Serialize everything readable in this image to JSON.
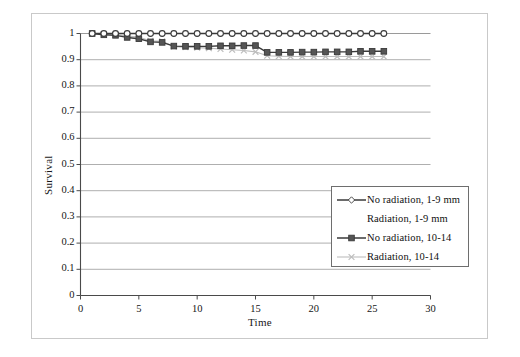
{
  "chart_data": {
    "type": "line",
    "title": "",
    "xlabel": "Time",
    "ylabel": "Survival",
    "xlim": [
      0,
      30
    ],
    "ylim": [
      0,
      1
    ],
    "xticks": [
      0,
      5,
      10,
      15,
      20,
      25,
      30
    ],
    "yticks": [
      0,
      0.1,
      0.2,
      0.3,
      0.4,
      0.5,
      0.6,
      0.7,
      0.8,
      0.9,
      1
    ],
    "xtick_labels": [
      "0",
      "5",
      "10",
      "15",
      "20",
      "25",
      "30"
    ],
    "ytick_labels": [
      "0",
      "0.1",
      "0.2",
      "0.3",
      "0.4",
      "0.5",
      "0.6",
      "0.7",
      "0.8",
      "0.9",
      "1"
    ],
    "grid": "horizontal",
    "legend_position": "lower-right-inside",
    "series": [
      {
        "name": "No radiation, 1-9 mm",
        "marker": "open-circle",
        "color": "#3a3a3a",
        "marker_fill": "#ffffff",
        "x": [
          1,
          2,
          3,
          4,
          5,
          6,
          7,
          8,
          9,
          10,
          11,
          12,
          13,
          14,
          15,
          16,
          17,
          18,
          19,
          20,
          21,
          22,
          23,
          24,
          25,
          26
        ],
        "values": [
          1.0,
          1.0,
          1.0,
          1.0,
          1.0,
          1.0,
          1.0,
          1.0,
          1.0,
          1.0,
          1.0,
          1.0,
          1.0,
          1.0,
          1.0,
          1.0,
          1.0,
          1.0,
          1.0,
          1.0,
          1.0,
          1.0,
          1.0,
          1.0,
          1.0,
          1.0
        ]
      },
      {
        "name": "Radiation, 1-9 mm",
        "marker": "none",
        "color": "#e8e8e8",
        "marker_fill": "#ffffff",
        "x": [
          1,
          2,
          3,
          4,
          5,
          6,
          7,
          8,
          9,
          10,
          11,
          12,
          13,
          14,
          15,
          16,
          17,
          18,
          19,
          20,
          21,
          22,
          23,
          24,
          25,
          26
        ],
        "values": [
          1.0,
          1.0,
          1.0,
          1.0,
          1.0,
          1.0,
          1.0,
          1.0,
          1.0,
          1.0,
          1.0,
          1.0,
          1.0,
          1.0,
          1.0,
          1.0,
          1.0,
          1.0,
          1.0,
          1.0,
          1.0,
          1.0,
          1.0,
          1.0,
          1.0,
          1.0
        ]
      },
      {
        "name": "No radiation, 10-14",
        "marker": "filled-square",
        "color": "#3a3a3a",
        "marker_fill": "#555555",
        "x": [
          1,
          2,
          3,
          4,
          5,
          6,
          7,
          8,
          9,
          10,
          11,
          12,
          13,
          14,
          15,
          16,
          17,
          18,
          19,
          20,
          21,
          22,
          23,
          24,
          25,
          26
        ],
        "values": [
          1.0,
          0.995,
          0.993,
          0.985,
          0.98,
          0.968,
          0.966,
          0.952,
          0.951,
          0.951,
          0.951,
          0.953,
          0.953,
          0.954,
          0.954,
          0.928,
          0.928,
          0.928,
          0.929,
          0.929,
          0.93,
          0.93,
          0.93,
          0.932,
          0.932,
          0.932
        ]
      },
      {
        "name": "Radiation, 10-14",
        "marker": "cross-x",
        "color": "#bdbdbd",
        "marker_fill": "#bdbdbd",
        "x": [
          1,
          2,
          3,
          4,
          5,
          6,
          7,
          8,
          9,
          10,
          11,
          12,
          13,
          14,
          15,
          16,
          17,
          18,
          19,
          20,
          21,
          22,
          23,
          24,
          25,
          26
        ],
        "values": [
          1.0,
          0.998,
          0.996,
          0.99,
          0.986,
          0.972,
          0.97,
          0.95,
          0.948,
          0.946,
          0.944,
          0.941,
          0.938,
          0.935,
          0.93,
          0.915,
          0.913,
          0.912,
          0.912,
          0.912,
          0.912,
          0.912,
          0.912,
          0.912,
          0.912,
          0.912
        ]
      }
    ]
  },
  "legend": {
    "items": [
      {
        "label": "No radiation, 1-9 mm"
      },
      {
        "label": "Radiation, 1-9 mm"
      },
      {
        "label": "No radiation, 10-14"
      },
      {
        "label": "Radiation, 10-14"
      }
    ]
  },
  "axes": {
    "y_title": "Survival",
    "x_title": "Time"
  },
  "colors": {
    "dark_series": "#3a3a3a",
    "light_series": "#bdbdbd",
    "gridline": "#9a9a9a",
    "axis": "#4a4a4a",
    "frame": "#c9c9c9",
    "background": "#ffffff"
  }
}
